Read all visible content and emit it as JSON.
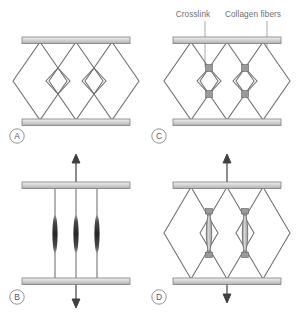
{
  "figure": {
    "background_color": "#ffffff",
    "line_color": "#6d6e71",
    "plate_fill_top": "#e8e8e8",
    "plate_fill_bottom": "#b5b5b5",
    "plate_stroke": "#808080",
    "crosslink_fill": "#9a9a9a",
    "fiber_dark": "#3a3a3a"
  },
  "annotations": [
    {
      "id": "crosslink",
      "label": "Crosslink",
      "x": 193,
      "y": 14
    },
    {
      "id": "collagen-fibers",
      "label": "Collagen fibers",
      "x": 236,
      "y": 14
    }
  ],
  "panels": [
    {
      "id": "A",
      "letter": "A",
      "state": "relaxed",
      "has_arrows": false,
      "has_crosslinks": false,
      "fiber_style": "lattice"
    },
    {
      "id": "B",
      "letter": "B",
      "state": "stretched",
      "has_arrows": true,
      "has_crosslinks": false,
      "fiber_style": "parallel-spindles"
    },
    {
      "id": "C",
      "letter": "C",
      "state": "relaxed",
      "has_arrows": false,
      "has_crosslinks": true,
      "fiber_style": "lattice-crosslinked"
    },
    {
      "id": "D",
      "letter": "D",
      "state": "stretched",
      "has_arrows": true,
      "has_crosslinks": true,
      "fiber_style": "lattice-crosslinked-stretched"
    }
  ]
}
